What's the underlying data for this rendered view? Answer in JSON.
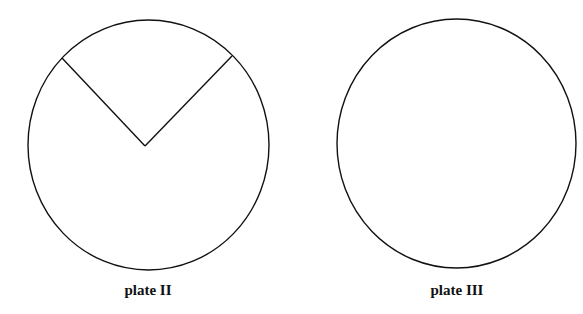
{
  "colors": {
    "stroke": "#111111",
    "background": "#ffffff"
  },
  "plates": [
    {
      "label": "plate II",
      "circle": {
        "cx": 148.5,
        "cy": 145,
        "rx": 120.5,
        "ry": 125
      },
      "cut_lines": [
        {
          "x1": 62,
          "y1": 58,
          "x2": 145,
          "y2": 146
        },
        {
          "x1": 145,
          "y1": 146,
          "x2": 232,
          "y2": 56
        }
      ],
      "label_x": 148,
      "label_y": 282
    },
    {
      "label": "plate III",
      "circle": {
        "cx": 456.5,
        "cy": 143.5,
        "rx": 119.5,
        "ry": 124.5
      },
      "cut_lines": [],
      "label_x": 457,
      "label_y": 282
    }
  ]
}
